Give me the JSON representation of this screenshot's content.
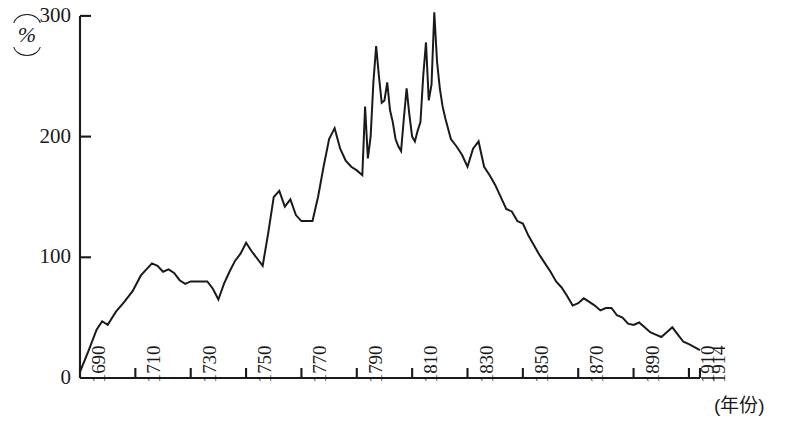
{
  "chart_data": {
    "type": "line",
    "title": "",
    "subtitle": "",
    "xlabel": "(年份)",
    "ylabel": "(%)",
    "ylabel_unit": "%",
    "xlim": [
      1690,
      1914
    ],
    "ylim": [
      0,
      300
    ],
    "grid": false,
    "legend": "none",
    "y_ticks": [
      0,
      100,
      200,
      300
    ],
    "y_tick_labels": [
      "0",
      "100",
      "200",
      "300"
    ],
    "x_ticks": [
      1690,
      1710,
      1730,
      1750,
      1770,
      1790,
      1810,
      1830,
      1850,
      1870,
      1890,
      1910,
      1914
    ],
    "x_tick_labels": [
      "1690",
      "1710",
      "1730",
      "1750",
      "1770",
      "1790",
      "1810",
      "1830",
      "1850",
      "1870",
      "1890",
      "1910",
      "1914"
    ],
    "series": [
      {
        "name": "",
        "x": [
          1690,
          1693,
          1696,
          1698,
          1700,
          1703,
          1706,
          1709,
          1712,
          1714,
          1716,
          1718,
          1720,
          1722,
          1724,
          1726,
          1728,
          1730,
          1732,
          1734,
          1736,
          1738,
          1740,
          1742,
          1744,
          1746,
          1748,
          1750,
          1752,
          1754,
          1756,
          1758,
          1760,
          1762,
          1764,
          1766,
          1768,
          1770,
          1772,
          1774,
          1776,
          1778,
          1780,
          1782,
          1784,
          1786,
          1788,
          1790,
          1792,
          1793,
          1794,
          1795,
          1796,
          1797,
          1798,
          1799,
          1800,
          1801,
          1802,
          1803,
          1804,
          1805,
          1806,
          1807,
          1808,
          1809,
          1810,
          1811,
          1812,
          1813,
          1814,
          1815,
          1816,
          1817,
          1818,
          1819,
          1820,
          1821,
          1822,
          1824,
          1826,
          1828,
          1830,
          1832,
          1834,
          1836,
          1838,
          1840,
          1842,
          1844,
          1846,
          1848,
          1850,
          1852,
          1854,
          1856,
          1858,
          1860,
          1862,
          1864,
          1866,
          1868,
          1870,
          1872,
          1874,
          1876,
          1878,
          1880,
          1882,
          1884,
          1886,
          1888,
          1890,
          1892,
          1894,
          1896,
          1898,
          1900,
          1902,
          1904,
          1906,
          1908,
          1910,
          1914
        ],
        "y": [
          5,
          22,
          40,
          47,
          44,
          55,
          63,
          72,
          85,
          90,
          95,
          93,
          88,
          90,
          87,
          81,
          78,
          80,
          80,
          80,
          80,
          74,
          65,
          78,
          88,
          97,
          103,
          112,
          105,
          99,
          93,
          120,
          150,
          155,
          142,
          148,
          135,
          130,
          130,
          130,
          150,
          175,
          198,
          207,
          190,
          180,
          175,
          172,
          168,
          225,
          182,
          200,
          245,
          275,
          250,
          228,
          230,
          245,
          222,
          212,
          198,
          192,
          188,
          215,
          240,
          218,
          200,
          196,
          205,
          212,
          250,
          278,
          230,
          243,
          303,
          262,
          240,
          225,
          215,
          198,
          192,
          185,
          175,
          190,
          196,
          175,
          168,
          160,
          150,
          140,
          138,
          130,
          128,
          118,
          110,
          102,
          95,
          88,
          80,
          75,
          68,
          60,
          62,
          66,
          63,
          60,
          56,
          58,
          58,
          52,
          50,
          45,
          44,
          46,
          42,
          38,
          36,
          34,
          38,
          42,
          36,
          30,
          28,
          23
        ]
      }
    ],
    "colors": {
      "line": "#1a1a1a",
      "axis": "#1a1a1a",
      "background": "#ffffff"
    }
  },
  "axis": {
    "y_unit_label": "%",
    "x_axis_caption": "(年份)"
  }
}
